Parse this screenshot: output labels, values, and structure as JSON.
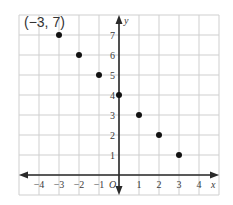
{
  "chart_data": {
    "type": "scatter",
    "title": "",
    "xlabel": "x",
    "ylabel": "y",
    "origin_label": "O",
    "xlim": [
      -5,
      5
    ],
    "ylim": [
      -1,
      8
    ],
    "grid": true,
    "x_ticks": [
      -4,
      -3,
      -2,
      -1,
      1,
      2,
      3,
      4
    ],
    "x_tick_labels": [
      "−4",
      "−3",
      "−2",
      "−1",
      "1",
      "2",
      "3",
      "4"
    ],
    "y_ticks": [
      1,
      2,
      3,
      4,
      5,
      6,
      7
    ],
    "y_tick_labels": [
      "1",
      "2",
      "3",
      "4",
      "5",
      "6",
      "7"
    ],
    "points": [
      {
        "x": -3,
        "y": 7
      },
      {
        "x": -2,
        "y": 6
      },
      {
        "x": -1,
        "y": 5
      },
      {
        "x": 0,
        "y": 4
      },
      {
        "x": 1,
        "y": 3
      },
      {
        "x": 2,
        "y": 2
      },
      {
        "x": 3,
        "y": 1
      }
    ],
    "annotations": [
      {
        "text": "(−3, 7)",
        "x": -3,
        "y": 7
      }
    ]
  },
  "colors": {
    "grid": "#cfcfcf",
    "axis": "#2a2a2a",
    "point": "#111111"
  }
}
